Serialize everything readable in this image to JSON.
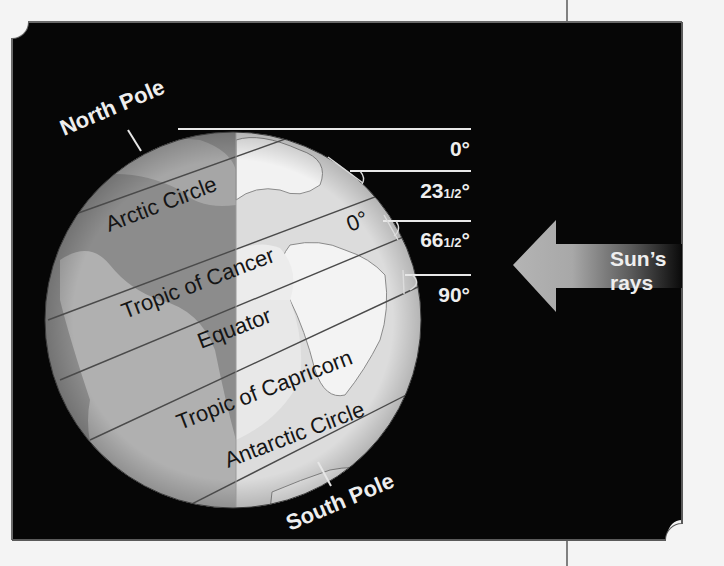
{
  "diagram": {
    "type": "earth-sun-angles",
    "colors": {
      "background": "#f4f4f4",
      "panel": "#060606",
      "panel_border": "#6a6a6a",
      "globe_night": "#8c8c8c",
      "globe_day": "#dedede",
      "lines_white": "#e8e8e8",
      "text_white": "#eeeeee",
      "text_dark": "#151515"
    },
    "pole_labels": {
      "north": "North Pole",
      "south": "South Pole"
    },
    "latitude_labels": {
      "arctic": "Arctic Circle",
      "cancer": "Tropic of Cancer",
      "equator": "Equator",
      "capricorn": "Tropic of Capricorn",
      "antarctic": "Antarctic Circle"
    },
    "surface_angle_label": "0°",
    "sun_angles": [
      {
        "whole": "0",
        "fraction": "",
        "unit": "°"
      },
      {
        "whole": "23",
        "fraction": "1/2",
        "unit": "°"
      },
      {
        "whole": "66",
        "fraction": "1/2",
        "unit": "°"
      },
      {
        "whole": "90",
        "fraction": "",
        "unit": "°"
      }
    ],
    "arrow": {
      "label_line1": "Sun’s",
      "label_line2": "rays",
      "icon": "left-arrow-icon"
    }
  }
}
